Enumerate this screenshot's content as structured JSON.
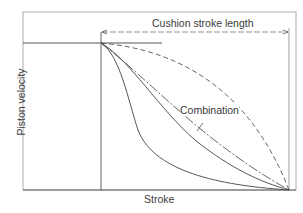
{
  "diagram": {
    "title_annotation": "Cushion stroke length",
    "xlabel": "Stroke",
    "ylabel": "Piston velocity",
    "curve_label": "Combination",
    "curves": [
      {
        "name": "dashed",
        "style": "dashed",
        "description": "gradual deceleration, convex"
      },
      {
        "name": "dash-dot",
        "style": "dash-dot",
        "description": "linear-ish deceleration"
      },
      {
        "name": "combination",
        "style": "solid",
        "description": "combination curve"
      },
      {
        "name": "rapid",
        "style": "solid",
        "description": "rapid early deceleration, concave"
      }
    ],
    "line_color": "#444444"
  }
}
